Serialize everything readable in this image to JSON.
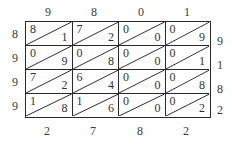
{
  "diagram": {
    "type": "lattice-multiplication",
    "top_digits": [
      "9",
      "8",
      "0",
      "1"
    ],
    "left_digits": [
      "8",
      "9",
      "9",
      "9"
    ],
    "right_digits": [
      "9",
      "1",
      "8",
      "2"
    ],
    "bottom_digits": [
      "2",
      "7",
      "8",
      "2"
    ],
    "cells": [
      [
        {
          "tens": "8",
          "ones": "1"
        },
        {
          "tens": "7",
          "ones": "2"
        },
        {
          "tens": "0",
          "ones": "0"
        },
        {
          "tens": "0",
          "ones": "9"
        }
      ],
      [
        {
          "tens": "0",
          "ones": "9"
        },
        {
          "tens": "0",
          "ones": "8"
        },
        {
          "tens": "0",
          "ones": "0"
        },
        {
          "tens": "0",
          "ones": "1"
        }
      ],
      [
        {
          "tens": "7",
          "ones": "2"
        },
        {
          "tens": "6",
          "ones": "4"
        },
        {
          "tens": "0",
          "ones": "0"
        },
        {
          "tens": "0",
          "ones": "8"
        }
      ],
      [
        {
          "tens": "1",
          "ones": "8"
        },
        {
          "tens": "1",
          "ones": "6"
        },
        {
          "tens": "0",
          "ones": "0"
        },
        {
          "tens": "0",
          "ones": "2"
        }
      ]
    ],
    "line_color": "#2a2a2a",
    "text_color": "#333333"
  }
}
